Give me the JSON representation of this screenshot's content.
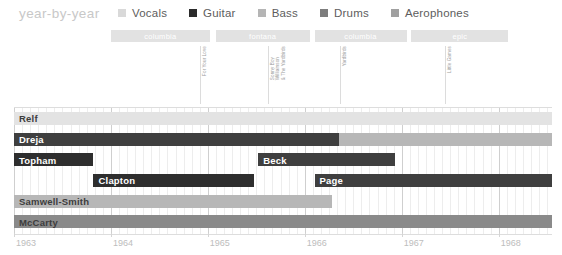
{
  "header": {
    "title": "year-by-year",
    "title_color": "#c8c8c8"
  },
  "legend": {
    "items": [
      {
        "label": "Vocals",
        "color": "#d9d9d9"
      },
      {
        "label": "Guitar",
        "color": "#2b2b2b"
      },
      {
        "label": "Bass",
        "color": "#b5b5b5"
      },
      {
        "label": "Drums",
        "color": "#7d7d7d"
      },
      {
        "label": "Aerophones",
        "color": "#a0a0a0"
      }
    ]
  },
  "record_labels": [
    {
      "name": "columbia",
      "start": 1964.0,
      "end": 1965.02
    },
    {
      "name": "fontana",
      "start": 1965.08,
      "end": 1966.05
    },
    {
      "name": "columbia",
      "start": 1966.1,
      "end": 1967.05
    },
    {
      "name": "epic",
      "start": 1967.1,
      "end": 1968.1
    }
  ],
  "releases": [
    {
      "title": "For Your Love",
      "lines": [
        "For Your Love"
      ],
      "x": 1964.92
    },
    {
      "title": "Sonny Boy Williamson & The Yardbirds",
      "lines": [
        "Sonny Boy",
        "Williamson",
        "& The Yardbirds"
      ],
      "x": 1965.62
    },
    {
      "title": "Yardbirds",
      "lines": [
        "Yardbirds"
      ],
      "x": 1966.36
    },
    {
      "title": "Little Games",
      "lines": [
        "Little Games"
      ],
      "x": 1967.45
    }
  ],
  "chart_data": {
    "type": "bar",
    "subtype": "gantt-timeline",
    "title": "year-by-year",
    "xlabel": "",
    "ylabel": "",
    "xlim": [
      1963.0,
      1968.55
    ],
    "grid": true,
    "legend_position": "top",
    "categories": [
      "Relf",
      "Dreja",
      "Topham",
      "Clapton",
      "Samwell-Smith",
      "McCarty"
    ],
    "tick_labels": [
      "1963",
      "1964",
      "1965",
      "1966",
      "1967",
      "1968"
    ],
    "tick_values": [
      1963,
      1964,
      1965,
      1966,
      1967,
      1968
    ],
    "series": [
      {
        "name": "Relf",
        "row": 0,
        "bars": [
          {
            "label": "Relf",
            "role": "Vocals",
            "color": "#e3e3e3",
            "start": 1963.0,
            "end": 1968.55,
            "name_style": "dark"
          }
        ]
      },
      {
        "name": "Dreja",
        "row": 1,
        "bars": [
          {
            "label": "Dreja",
            "role": "Guitar",
            "color": "#3f3f3f",
            "start": 1963.0,
            "end": 1966.35,
            "name_style": "light"
          },
          {
            "label": "",
            "role": "Bass",
            "color": "#b7b7b7",
            "start": 1966.35,
            "end": 1968.55,
            "name_style": "light"
          }
        ]
      },
      {
        "name": "Topham",
        "row": 2,
        "bars": [
          {
            "label": "Topham",
            "role": "Guitar",
            "color": "#2e2e2e",
            "start": 1963.0,
            "end": 1963.82,
            "name_style": "light"
          },
          {
            "label": "Beck",
            "role": "Guitar",
            "color": "#3f3f3f",
            "start": 1965.52,
            "end": 1966.93,
            "name_style": "light"
          }
        ]
      },
      {
        "name": "Clapton",
        "row": 3,
        "bars": [
          {
            "label": "Clapton",
            "role": "Guitar",
            "color": "#2e2e2e",
            "start": 1963.82,
            "end": 1965.48,
            "name_style": "light"
          },
          {
            "label": "Page",
            "role": "Guitar",
            "color": "#3f3f3f",
            "start": 1966.1,
            "end": 1968.55,
            "name_style": "light"
          }
        ]
      },
      {
        "name": "Samwell-Smith",
        "row": 4,
        "bars": [
          {
            "label": "Samwell-Smith",
            "role": "Bass",
            "color": "#b7b7b7",
            "start": 1963.0,
            "end": 1966.28,
            "name_style": "dark"
          }
        ]
      },
      {
        "name": "McCarty",
        "row": 5,
        "bars": [
          {
            "label": "McCarty",
            "role": "Drums",
            "color": "#8a8a8a",
            "start": 1963.0,
            "end": 1968.55,
            "name_style": "dark"
          }
        ]
      }
    ]
  }
}
